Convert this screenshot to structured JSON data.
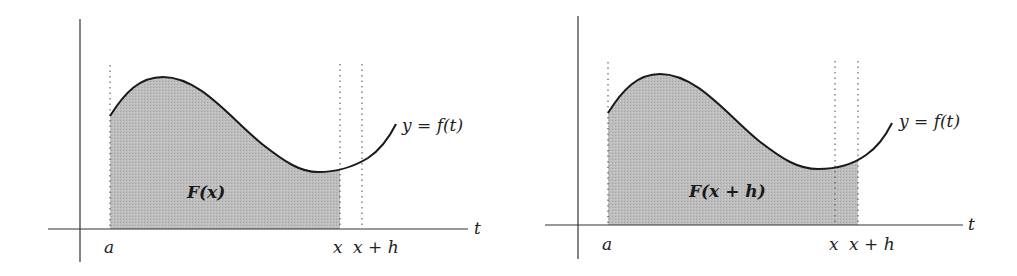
{
  "figure": {
    "type": "fundamental-theorem-of-calculus-illustration",
    "shade_color": "#b8b8b8",
    "curve_color": "#1a1a1a",
    "axis_color": "#333333",
    "panels": [
      {
        "id": "left",
        "axis_label": "t",
        "curve_label": "y = f(t)",
        "area_label": "F(x)",
        "tick_labels": [
          "a",
          "x",
          "x + h"
        ],
        "shaded_from": "a",
        "shaded_to": "x"
      },
      {
        "id": "right",
        "axis_label": "t",
        "curve_label": "y = f(t)",
        "area_label": "F(x + h)",
        "tick_labels": [
          "a",
          "x",
          "x + h"
        ],
        "shaded_from": "a",
        "shaded_to": "x + h"
      }
    ]
  }
}
